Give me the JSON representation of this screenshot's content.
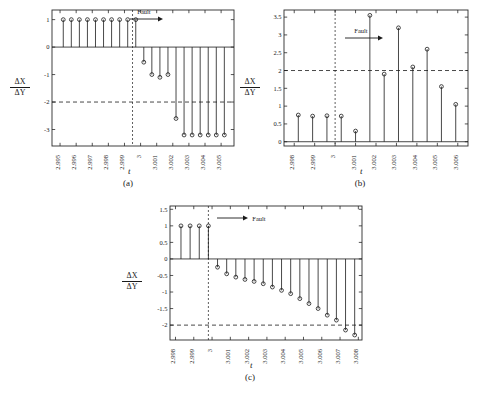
{
  "figure": {
    "background": "#ffffff",
    "axis_color": "#2a2a2a",
    "stem_color": "#1a1a1a",
    "dash_color": "#1a1a1a"
  },
  "panels": [
    {
      "caption": "(a)",
      "xlabel": "t",
      "ylabel_top": "ΔX",
      "ylabel_bottom": "ΔY",
      "annotation": "Fault",
      "chart_data": {
        "type": "scatter",
        "title": "",
        "xlabel": "t",
        "ylabel": "ΔX/ΔY",
        "xlim": [
          2.9945,
          3.0058
        ],
        "ylim": [
          -3.6,
          1.35
        ],
        "xticks": [
          2.995,
          2.996,
          2.997,
          2.998,
          2.999,
          3,
          3.001,
          3.002,
          3.003,
          3.004,
          3.005
        ],
        "xticklabels": [
          "2.995",
          "2.996",
          "2.997",
          "2.998",
          "2.999",
          "3",
          "3.001",
          "3.002",
          "3.003",
          "3.004",
          "3.005"
        ],
        "yticks": [
          1,
          0,
          -1,
          -2,
          -3
        ],
        "yticklabels": [
          "1",
          "0",
          "-1",
          "-2",
          "-3"
        ],
        "threshold": -2,
        "fault_time": 2.9995,
        "grid": false,
        "x": [
          2.9952,
          2.9957,
          2.9962,
          2.9967,
          2.9972,
          2.9977,
          2.9982,
          2.9987,
          2.9992,
          2.9997,
          3.0002,
          3.0007,
          3.0012,
          3.0017,
          3.0022,
          3.0027,
          3.0032,
          3.0037,
          3.0042,
          3.0047,
          3.0052
        ],
        "y": [
          1,
          1,
          1,
          1,
          1,
          1,
          1,
          1,
          1,
          1,
          -0.55,
          -1.0,
          -1.1,
          -1.0,
          -2.6,
          -3.2,
          -3.2,
          -3.2,
          -3.2,
          -3.2,
          -3.2
        ]
      }
    },
    {
      "caption": "(b)",
      "xlabel": "t",
      "ylabel_top": "ΔX",
      "ylabel_bottom": "ΔY",
      "annotation": "Fault",
      "chart_data": {
        "type": "scatter",
        "title": "",
        "xlabel": "t",
        "ylabel": "ΔX/ΔY",
        "xlim": [
          2.9975,
          3.0065
        ],
        "ylim": [
          -0.12,
          3.7
        ],
        "xticks": [
          2.998,
          2.999,
          3,
          3.001,
          3.002,
          3.003,
          3.004,
          3.005,
          3.006
        ],
        "xticklabels": [
          "2.998",
          "2.999",
          "3",
          "3.001",
          "3.002",
          "3.003",
          "3.004",
          "3.005",
          "3.006"
        ],
        "yticks": [
          0,
          0.5,
          1,
          1.5,
          2,
          2.5,
          3,
          3.5
        ],
        "yticklabels": [
          "0",
          "0.5",
          "1",
          "1.5",
          "2",
          "2.5",
          "3",
          "3.5"
        ],
        "threshold": 2,
        "fault_time": 3.0,
        "grid": false,
        "x": [
          2.9982,
          2.9989,
          2.9996,
          3.0003,
          3.001,
          3.0017,
          3.0024,
          3.0031,
          3.0038,
          3.0045,
          3.0052,
          3.0059
        ],
        "y": [
          0.75,
          0.72,
          0.73,
          0.72,
          0.3,
          3.55,
          1.9,
          3.2,
          2.1,
          2.6,
          1.55,
          1.05
        ]
      }
    },
    {
      "caption": "(c)",
      "xlabel": "t",
      "ylabel_top": "ΔX",
      "ylabel_bottom": "ΔY",
      "annotation": "Fault",
      "chart_data": {
        "type": "scatter",
        "title": "",
        "xlabel": "t",
        "ylabel": "ΔX/ΔY",
        "xlim": [
          2.9977,
          3.0082
        ],
        "ylim": [
          -2.45,
          1.6
        ],
        "xticks": [
          2.998,
          2.999,
          3,
          3.001,
          3.002,
          3.003,
          3.004,
          3.005,
          3.006,
          3.007,
          3.008
        ],
        "xticklabels": [
          "2.998",
          "2.999",
          "3",
          "3.001",
          "3.002",
          "3.003",
          "3.004",
          "3.005",
          "3.006",
          "3.007",
          "3.008"
        ],
        "yticks": [
          1.5,
          1,
          0.5,
          0,
          -0.5,
          -1,
          -1.5,
          -2
        ],
        "yticklabels": [
          "1.5",
          "1",
          "0.5",
          "0",
          "-0.5",
          "-1",
          "-1.5",
          "-2"
        ],
        "threshold": -2,
        "fault_time": 2.9998,
        "grid": false,
        "x": [
          2.9983,
          2.9988,
          2.9993,
          2.9998,
          3.0003,
          3.0008,
          3.0013,
          3.0018,
          3.0023,
          3.0028,
          3.0033,
          3.0038,
          3.0043,
          3.0048,
          3.0053,
          3.0058,
          3.0063,
          3.0068,
          3.0073,
          3.0078
        ],
        "y": [
          1,
          1,
          1,
          1,
          -0.25,
          -0.45,
          -0.55,
          -0.62,
          -0.68,
          -0.75,
          -0.85,
          -0.95,
          -1.05,
          -1.2,
          -1.35,
          -1.5,
          -1.7,
          -1.85,
          -2.15,
          -2.3
        ]
      }
    }
  ]
}
